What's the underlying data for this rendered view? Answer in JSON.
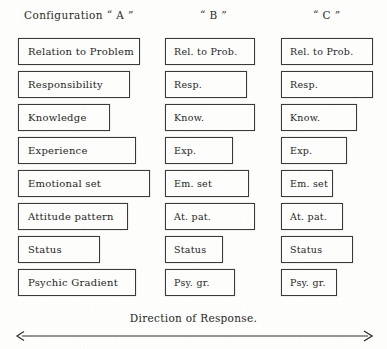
{
  "figure": {
    "caption": "Direction of Response.",
    "arrow": {
      "name": "direction-of-response-arrow",
      "style": "double-headed",
      "color": "#2f2f2f"
    },
    "headers": [
      {
        "id": "a",
        "text": "Configuration “ A ”"
      },
      {
        "id": "b",
        "text": "“ B ”"
      },
      {
        "id": "c",
        "text": "“ C ”"
      }
    ],
    "columns": [
      {
        "id": "a",
        "name": "configuration-a",
        "boxes": [
          {
            "label": "Relation to Problem",
            "width": 122
          },
          {
            "label": "Responsibility",
            "width": 112
          },
          {
            "label": "Knowledge",
            "width": 92
          },
          {
            "label": "Experience",
            "width": 118
          },
          {
            "label": "Emotional set",
            "width": 132
          },
          {
            "label": "Attitude pattern",
            "width": 110
          },
          {
            "label": "Status",
            "width": 82
          },
          {
            "label": "Psychic Gradient",
            "width": 118
          }
        ]
      },
      {
        "id": "b",
        "name": "configuration-b",
        "boxes": [
          {
            "label": "Rel. to Prob.",
            "width": 90
          },
          {
            "label": "Resp.",
            "width": 82
          },
          {
            "label": "Know.",
            "width": 90
          },
          {
            "label": "Exp.",
            "width": 68
          },
          {
            "label": "Em. set",
            "width": 84
          },
          {
            "label": "At. pat.",
            "width": 90
          },
          {
            "label": "Status",
            "width": 58
          },
          {
            "label": "Psy. gr.",
            "width": 70
          }
        ]
      },
      {
        "id": "c",
        "name": "configuration-c",
        "boxes": [
          {
            "label": "Rel. to Prob.",
            "width": 92
          },
          {
            "label": "Resp.",
            "width": 92
          },
          {
            "label": "Know.",
            "width": 76
          },
          {
            "label": "Exp.",
            "width": 66
          },
          {
            "label": "Em. set",
            "width": 52
          },
          {
            "label": "At. pat.",
            "width": 62
          },
          {
            "label": "Status",
            "width": 72
          },
          {
            "label": "Psy. gr.",
            "width": 56
          }
        ]
      }
    ]
  }
}
